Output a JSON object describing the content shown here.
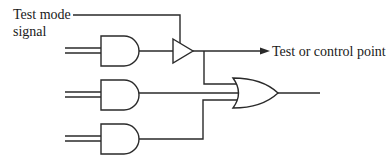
{
  "diagram": {
    "labels": {
      "test_mode_line1": "Test mode",
      "test_mode_line2": "signal",
      "output_point": "Test or control point"
    },
    "components": [
      {
        "id": "and1",
        "type": "AND",
        "inputs": 2
      },
      {
        "id": "and2",
        "type": "AND",
        "inputs": 2
      },
      {
        "id": "and3",
        "type": "AND",
        "inputs": 2
      },
      {
        "id": "buffer",
        "type": "tri-state buffer",
        "enable": "Test mode signal"
      },
      {
        "id": "or1",
        "type": "OR",
        "inputs": 3
      }
    ],
    "connections": [
      "Test mode signal -> buffer enable",
      "and1 output -> buffer input",
      "buffer output -> Test or control point",
      "buffer output -> or1 input 1",
      "and2 output -> or1 input 2",
      "and3 output -> or1 input 3"
    ],
    "colors": {
      "stroke": "#2a2a2a",
      "background": "#ffffff",
      "text": "#1a1a1a"
    }
  }
}
